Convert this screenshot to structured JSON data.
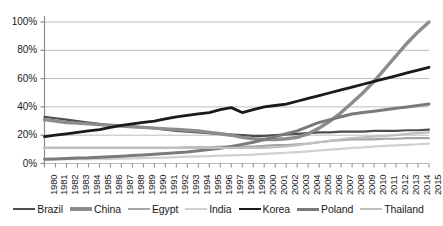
{
  "chart_data": {
    "type": "line",
    "title": "",
    "subtitle": "",
    "xlabel": "",
    "ylabel": "",
    "grid": true,
    "legend_position": "bottom",
    "xlim": [
      1980,
      2015
    ],
    "ylim": [
      0,
      100
    ],
    "ytick_labels": [
      "100%",
      "80%",
      "60%",
      "40%",
      "20%",
      "0%"
    ],
    "ytick_values": [
      100,
      80,
      60,
      40,
      20,
      0
    ],
    "categories": [
      "1980",
      "1981",
      "1982",
      "1983",
      "1984",
      "1985",
      "1986",
      "1987",
      "1988",
      "1989",
      "1990",
      "1991",
      "1992",
      "1993",
      "1994",
      "1995",
      "1996",
      "1997",
      "1998",
      "1999",
      "2000",
      "2001",
      "2002",
      "2003",
      "2004",
      "2005",
      "2006",
      "2007",
      "2008",
      "2009",
      "2010",
      "2011",
      "2012",
      "2013",
      "2014",
      "2015"
    ],
    "series": [
      {
        "name": "Brazil",
        "color": "#4d4d4d",
        "width": 2.2,
        "values": [
          33,
          32,
          31,
          30,
          29,
          28,
          27,
          26.5,
          26,
          25.5,
          25,
          24,
          23,
          22.5,
          22,
          21.5,
          21,
          20.5,
          20,
          19.5,
          19.5,
          20,
          20.5,
          21,
          21.5,
          22,
          22,
          22.5,
          22.5,
          22.5,
          23,
          23,
          23,
          23.5,
          23.5,
          24
        ]
      },
      {
        "name": "China",
        "color": "#8c8c8c",
        "width": 3.4,
        "values": [
          31,
          30,
          29,
          28.5,
          28,
          27.5,
          27,
          26.5,
          26,
          25.5,
          25,
          24.5,
          24,
          23.5,
          23,
          22,
          21,
          20,
          18.5,
          17.5,
          17,
          17,
          17.5,
          18.5,
          21,
          25,
          30,
          36,
          43,
          50,
          58,
          67,
          76,
          85,
          93,
          100
        ]
      },
      {
        "name": "Egypt",
        "color": "#a6a6a6",
        "width": 2.2,
        "values": [
          11,
          11,
          11,
          11,
          11,
          11,
          11,
          11,
          11,
          11,
          11,
          11,
          11,
          11.5,
          11.5,
          11.5,
          12,
          12,
          12,
          12,
          12.5,
          13,
          13,
          13.5,
          14,
          15,
          16,
          16.5,
          17,
          17,
          17,
          17.5,
          17.5,
          18,
          18,
          18
        ]
      },
      {
        "name": "India",
        "color": "#d0d0d0",
        "width": 2.2,
        "values": [
          3,
          3,
          3,
          3,
          3,
          3,
          3.2,
          3.4,
          3.6,
          3.8,
          4,
          4.2,
          4.5,
          4.8,
          5,
          5.2,
          5.5,
          5.8,
          6,
          6.3,
          6.8,
          7.2,
          7.6,
          8,
          8.6,
          9.2,
          9.8,
          10.4,
          11,
          11.4,
          12,
          12.4,
          12.8,
          13.2,
          13.6,
          14
        ]
      },
      {
        "name": "Korea",
        "color": "#1a1a1a",
        "width": 2.8,
        "values": [
          19,
          20,
          21,
          22,
          23,
          24,
          25.5,
          27,
          28,
          29,
          30,
          31.5,
          33,
          34,
          35,
          36,
          38,
          39.5,
          36,
          38,
          40,
          41,
          42,
          44,
          46,
          48,
          50,
          52,
          54,
          56,
          58,
          60,
          62,
          64,
          66,
          68
        ]
      },
      {
        "name": "Poland",
        "color": "#7a7a7a",
        "width": 3.0,
        "values": [
          3,
          3.2,
          3.5,
          3.8,
          4,
          4.4,
          4.8,
          5.2,
          5.6,
          6,
          6.5,
          7,
          7.6,
          8.2,
          9,
          9.8,
          10.8,
          12,
          13.5,
          15,
          17,
          19,
          21,
          23,
          26,
          29,
          31,
          33,
          35,
          36,
          37,
          38,
          39,
          40,
          41,
          42
        ]
      },
      {
        "name": "Thailand",
        "color": "#bfbfbf",
        "width": 2.2,
        "values": [
          11,
          11,
          11,
          11,
          11,
          11,
          11,
          11,
          11,
          11,
          11,
          11,
          11,
          11,
          11,
          11,
          11,
          11,
          11,
          11,
          11,
          11.5,
          12,
          13,
          14,
          15,
          16,
          17,
          18,
          18.5,
          19,
          19.5,
          20,
          21,
          21.5,
          22
        ]
      }
    ]
  }
}
